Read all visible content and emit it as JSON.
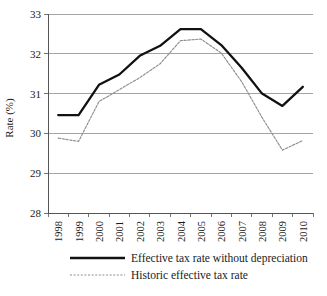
{
  "chart_data": {
    "type": "line",
    "title": "",
    "xlabel": "",
    "ylabel": "Rate (%)",
    "categories": [
      "1998",
      "1999",
      "2000",
      "2001",
      "2002",
      "2003",
      "2004",
      "2005",
      "2006",
      "2007",
      "2008",
      "2009",
      "2010"
    ],
    "ylim": [
      28,
      33
    ],
    "yticks": [
      28,
      29,
      30,
      31,
      32,
      33
    ],
    "ytick_labels": [
      "28",
      "29",
      "30",
      "31",
      "32",
      "33"
    ],
    "grid": "horizontal",
    "legend_position": "bottom",
    "series": [
      {
        "name": "Effective tax rate without depreciation",
        "style": "solid",
        "color": "#111111",
        "values": [
          30.46,
          30.46,
          31.22,
          31.48,
          31.95,
          32.2,
          32.62,
          32.62,
          32.22,
          31.65,
          31.0,
          30.69,
          31.17
        ]
      },
      {
        "name": "Historic effective tax rate",
        "style": "dashed",
        "color": "#8d8d8d",
        "values": [
          29.88,
          29.8,
          30.8,
          31.1,
          31.4,
          31.75,
          32.33,
          32.37,
          32.02,
          31.3,
          30.4,
          29.58,
          29.82
        ]
      }
    ]
  },
  "legend": {
    "items": [
      {
        "label": "Effective tax rate without depreciation",
        "style": "solid"
      },
      {
        "label": "Historic effective tax rate",
        "style": "dashed"
      }
    ]
  },
  "axes": {
    "y_axis_title": "Rate (%)"
  }
}
